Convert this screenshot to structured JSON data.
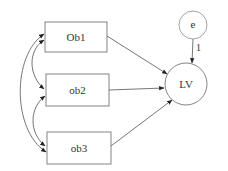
{
  "diagram": {
    "type": "path-diagram",
    "colors": {
      "stroke": "#777777",
      "fill": "#ffffff",
      "arrow": "#222222",
      "text": "#333333"
    },
    "observed": [
      {
        "id": "ob1",
        "label": "Ob1",
        "x": 45,
        "y": 22,
        "w": 62,
        "h": 30
      },
      {
        "id": "ob2",
        "label": "ob2",
        "x": 46,
        "y": 74,
        "w": 63,
        "h": 32
      },
      {
        "id": "ob3",
        "label": "ob3",
        "x": 47,
        "y": 132,
        "w": 64,
        "h": 32
      }
    ],
    "latent": {
      "id": "lv",
      "label": "LV",
      "cx": 186,
      "cy": 84,
      "r": 21
    },
    "error": {
      "id": "e",
      "label": "e",
      "cx": 193,
      "cy": 25,
      "r": 14
    },
    "error_path_label": "1",
    "paths": [
      {
        "from": "ob1",
        "to": "lv"
      },
      {
        "from": "ob2",
        "to": "lv"
      },
      {
        "from": "ob3",
        "to": "lv"
      },
      {
        "from": "e",
        "to": "lv",
        "label": "1"
      }
    ],
    "covariances": [
      {
        "between": [
          "ob1",
          "ob2"
        ]
      },
      {
        "between": [
          "ob2",
          "ob3"
        ]
      },
      {
        "between": [
          "ob1",
          "ob3"
        ]
      }
    ]
  }
}
